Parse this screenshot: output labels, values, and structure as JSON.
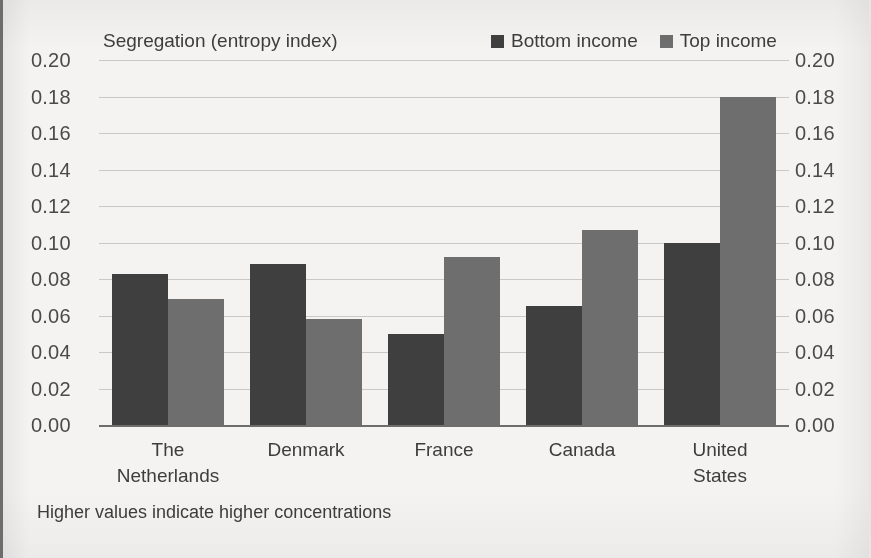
{
  "chart_data": {
    "type": "bar",
    "title": "Segregation (entropy index)",
    "xlabel": "",
    "ylabel": "Segregation (entropy index)",
    "ylim": [
      0.0,
      0.2
    ],
    "ytick_step": 0.02,
    "ytick_labels": [
      "0.20",
      "0.18",
      "0.16",
      "0.14",
      "0.12",
      "0.10",
      "0.08",
      "0.06",
      "0.04",
      "0.02",
      "0.00"
    ],
    "ytick_values": [
      0.2,
      0.18,
      0.16,
      0.14,
      0.12,
      0.1,
      0.08,
      0.06,
      0.04,
      0.02,
      0.0
    ],
    "grid": true,
    "dual_axis": true,
    "legend_position": "top-right",
    "categories": [
      "The\nNetherlands",
      "Denmark",
      "France",
      "Canada",
      "United States"
    ],
    "series": [
      {
        "name": "Bottom income",
        "color": "#3f3f3f",
        "values": [
          0.083,
          0.088,
          0.05,
          0.065,
          0.1
        ]
      },
      {
        "name": "Top income",
        "color": "#6e6e6e",
        "values": [
          0.069,
          0.058,
          0.092,
          0.107,
          0.18
        ]
      }
    ],
    "annotation": "Higher values indicate higher concentrations"
  },
  "figure": {
    "title": "Segregation (entropy index)",
    "footnote": "Higher values indicate higher concentrations",
    "background_color": "#f4f3f1",
    "gridline_color": "#c9c8c6",
    "axis_color": "#6e6d6b",
    "text_color": "#3d3d3d"
  }
}
